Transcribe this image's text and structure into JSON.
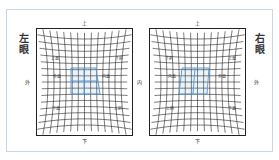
{
  "diagram": {
    "colors": {
      "grid": "#222222",
      "highlight": "#5a9bd4",
      "frame": "#c9d6e3"
    },
    "left_eye": {
      "title": "左眼",
      "directions": {
        "top": "上",
        "bottom": "下",
        "left": "外",
        "right": "内"
      },
      "muscles": {
        "upper_left": "上直",
        "upper_right": "下斜",
        "mid_left": "外直",
        "mid_right": "内直",
        "lower_left": "下直",
        "lower_right": "上斜"
      }
    },
    "right_eye": {
      "title": "右眼",
      "directions": {
        "top": "上",
        "bottom": "下",
        "left": "内",
        "right": "外"
      },
      "muscles": {
        "upper_left": "下斜",
        "upper_right": "上直",
        "mid_left": "内直",
        "mid_right": "外直",
        "lower_left": "上斜",
        "lower_right": "下直"
      }
    },
    "center_label": "内"
  }
}
